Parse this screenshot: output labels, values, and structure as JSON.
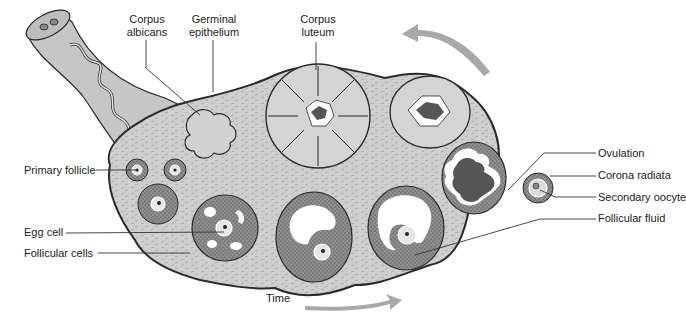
{
  "figure": {
    "title_cropped": ""
  },
  "labels": {
    "corpus_albicans": [
      "Corpus",
      "albicans"
    ],
    "germinal_epithelium": [
      "Germinal",
      "epithelium"
    ],
    "corpus_luteum": [
      "Corpus",
      "luteum"
    ],
    "primary_follicle": "Primary follicle",
    "egg_cell": "Egg cell",
    "follicular_cells": "Follicular cells",
    "ovulation": "Ovulation",
    "corona_radiata": "Corona radiata",
    "secondary_oocyte": "Secondary oocyte",
    "follicular_fluid": "Follicular fluid",
    "time": "Time"
  },
  "colors": {
    "tissue": "#c9c9c9",
    "tissue_light": "#d9d9d9",
    "dark_fill": "#555555",
    "granulosa": "#8a8a8a",
    "outline": "#2a2a2a",
    "arrow": "#a8a8a8",
    "leader_line": "#333333",
    "text": "#222222"
  }
}
